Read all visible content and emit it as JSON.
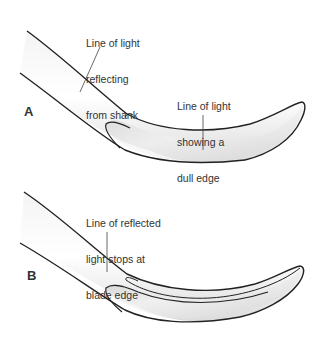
{
  "figure": {
    "panels": [
      {
        "id": "A",
        "letter": "A",
        "callouts": [
          {
            "lines": [
              "Line of light",
              "reflecting",
              "from shank"
            ]
          },
          {
            "lines": [
              "Line of light",
              "showing a",
              "dull edge"
            ]
          }
        ]
      },
      {
        "id": "B",
        "letter": "B",
        "callouts": [
          {
            "lines": [
              "Line of reflected",
              "light stops at",
              "blade edge"
            ]
          }
        ]
      }
    ],
    "colors": {
      "outline": "#222222",
      "text": "#333333",
      "shade": "#c8c8c8",
      "background": "#ffffff"
    }
  }
}
